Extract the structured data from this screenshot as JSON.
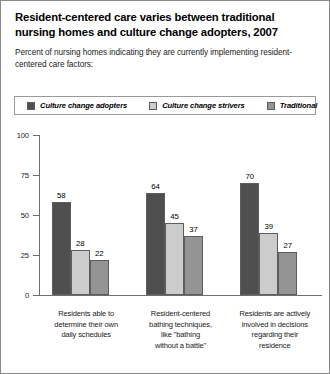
{
  "header": {
    "title": "Resident-centered care varies between traditional nursing homes and culture change adopters, 2007",
    "subtitle": "Percent of nursing homes indicating they are currently implementing resident-centered care factors:"
  },
  "colors": {
    "adopters": "#4f4f4f",
    "strivers": "#cccccc",
    "traditional": "#949494",
    "axis": "#6e6e6e",
    "border": "#8a8a8a",
    "text": "#1a1a1a"
  },
  "legend": {
    "items": [
      {
        "label": "Culture change adopters",
        "color": "#4f4f4f",
        "swatch_name": "legend-swatch-adopters"
      },
      {
        "label": "Culture change strivers",
        "color": "#cccccc",
        "swatch_name": "legend-swatch-strivers"
      },
      {
        "label": "Traditional",
        "color": "#949494",
        "swatch_name": "legend-swatch-traditional"
      }
    ]
  },
  "chart_data": {
    "type": "bar",
    "title": "Resident-centered care varies between traditional nursing homes and culture change adopters, 2007",
    "subtitle": "Percent of nursing homes indicating they are currently implementing resident-centered care factors:",
    "xlabel": "",
    "ylabel": "",
    "ylim": [
      0,
      100
    ],
    "yticks": [
      0,
      25,
      50,
      75,
      100
    ],
    "ytick_labels": [
      "0",
      "25",
      "50",
      "75",
      "100"
    ],
    "grid": false,
    "legend_position": "top",
    "categories": [
      "Residents able to determine their own daily schedules",
      "Resident-centered bathing techniques, like \"bathing without a battle\"",
      "Residents are actively involved in decisions regarding their residence"
    ],
    "category_lines": [
      [
        "Residents able to",
        "determine their own",
        "daily schedules"
      ],
      [
        "Resident-centered",
        "bathing techniques,",
        "like \"bathing",
        "without a battle\""
      ],
      [
        "Residents are actively",
        "involved in decisions",
        "regarding their",
        "residence"
      ]
    ],
    "series": [
      {
        "name": "Culture change adopters",
        "color": "#4f4f4f",
        "values": [
          58,
          64,
          70
        ]
      },
      {
        "name": "Culture change strivers",
        "color": "#cccccc",
        "values": [
          28,
          45,
          39
        ]
      },
      {
        "name": "Traditional",
        "color": "#949494",
        "values": [
          22,
          37,
          27
        ]
      }
    ]
  }
}
